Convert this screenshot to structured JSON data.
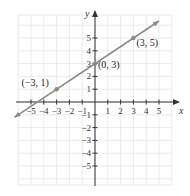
{
  "chart_data": {
    "type": "line",
    "title": "",
    "xlabel": "x",
    "ylabel": "y",
    "xlim": [
      -6,
      6
    ],
    "ylim": [
      -6.5,
      6.5
    ],
    "grid": true,
    "x_ticks": [
      -5,
      -4,
      -3,
      -2,
      -1,
      1,
      2,
      3,
      4,
      5
    ],
    "y_ticks": [
      -5,
      -4,
      -3,
      -2,
      -1,
      1,
      2,
      3,
      4,
      5
    ],
    "x_tick_labels": [
      "−5",
      "−4",
      "−3",
      "−2",
      "−1",
      "1",
      "2",
      "3",
      "4",
      "5"
    ],
    "y_tick_labels": [
      "−5",
      "−4",
      "−3",
      "−2",
      "−1",
      "1",
      "2",
      "3",
      "4",
      "5"
    ],
    "series": [
      {
        "name": "line",
        "equation": "y = (2/3)x + 3",
        "x": [
          -6.3,
          5.0
        ],
        "y": [
          -1.2,
          6.33
        ],
        "color": "#8a8a8a"
      }
    ],
    "points": [
      {
        "x": -3,
        "y": 1,
        "label": "(−3, 1)"
      },
      {
        "x": 0,
        "y": 3,
        "label": "(0, 3)"
      },
      {
        "x": 3,
        "y": 5,
        "label": "(3, 5)"
      }
    ]
  }
}
